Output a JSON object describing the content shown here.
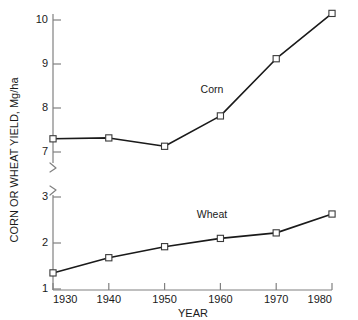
{
  "chart_data": {
    "type": "line",
    "title": "",
    "xlabel": "YEAR",
    "ylabel": "CORN OR WHEAT YIELD, Mg/ha",
    "x": [
      1930,
      1940,
      1950,
      1960,
      1970,
      1980
    ],
    "xtick_labels": [
      "1930",
      "1940",
      "1950",
      "1960",
      "1970",
      "1980"
    ],
    "xlim": [
      1930,
      1980
    ],
    "grid": false,
    "legend_position": "inline-annotation",
    "broken_axis": true,
    "panels": [
      {
        "name": "corn-panel",
        "ylim": [
          6.75,
          10.45
        ],
        "yticks": [
          7,
          8,
          9,
          10
        ],
        "ytick_labels": [
          "7",
          "8",
          "9",
          "10"
        ],
        "break_marker": "bottom",
        "series": {
          "name": "Corn",
          "annotation": "Corn",
          "marker": "open-square",
          "values": [
            7.3,
            7.32,
            7.13,
            7.82,
            9.12,
            10.15
          ]
        }
      },
      {
        "name": "wheat-panel",
        "ylim": [
          1.0,
          3.25
        ],
        "yticks": [
          1,
          2,
          3
        ],
        "ytick_labels": [
          "1",
          "2",
          "3"
        ],
        "break_marker": "top",
        "series": {
          "name": "Wheat",
          "annotation": "Wheat",
          "marker": "open-square",
          "values": [
            1.35,
            1.68,
            1.92,
            2.1,
            2.22,
            2.63
          ]
        }
      }
    ],
    "colors": {
      "line": "#1a1a1a",
      "marker_fill": "#ffffff",
      "marker_stroke": "#3a3a3a",
      "axis": "#808080",
      "text": "#1a1a1a",
      "background": "#ffffff"
    }
  }
}
